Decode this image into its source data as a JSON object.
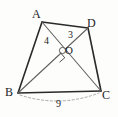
{
  "figure": {
    "kind": "geometry-diagram",
    "background_color": "#fdfdfc",
    "stroke_color": "#2a2a2a",
    "thin_stroke_color": "#6b6b6b",
    "dashed_color": "#8a8a8a",
    "canvas": {
      "width": 118,
      "height": 117
    }
  },
  "vertices": [
    {
      "name": "A",
      "label": "A",
      "x": 42,
      "y": 22,
      "label_x": 33,
      "label_y": 8
    },
    {
      "name": "D",
      "label": "D",
      "x": 88,
      "y": 28,
      "label_x": 88,
      "label_y": 17
    },
    {
      "name": "B",
      "label": "B",
      "x": 18,
      "y": 93,
      "label_x": 6,
      "label_y": 87
    },
    {
      "name": "C",
      "label": "C",
      "x": 101,
      "y": 91,
      "label_x": 102,
      "label_y": 89
    },
    {
      "name": "O",
      "label": "O",
      "x": 63,
      "y": 50,
      "label_x": 66,
      "label_y": 46
    }
  ],
  "edges": [
    {
      "name": "side-AB",
      "from": "A",
      "to": "B",
      "style": "solid",
      "weight": "thick"
    },
    {
      "name": "side-AD",
      "from": "A",
      "to": "D",
      "style": "solid",
      "weight": "thick"
    },
    {
      "name": "side-DC",
      "from": "D",
      "to": "C",
      "style": "solid",
      "weight": "thick"
    },
    {
      "name": "side-BC",
      "from": "B",
      "to": "C",
      "style": "solid",
      "weight": "thick"
    },
    {
      "name": "diagonal-AC",
      "from": "A",
      "to": "C",
      "style": "solid",
      "weight": "thin"
    },
    {
      "name": "diagonal-BD",
      "from": "B",
      "to": "D",
      "style": "solid",
      "weight": "thin"
    }
  ],
  "measures": [
    {
      "name": "segment-AO-length",
      "value": "4",
      "on": "diagonal-AC",
      "x": 44,
      "y": 37
    },
    {
      "name": "segment-OD-length",
      "value": "3",
      "on": "diagonal-BD",
      "x": 67,
      "y": 31
    },
    {
      "name": "side-BC-length",
      "value": "9",
      "on": "side-BC",
      "x": 56,
      "y": 99
    }
  ],
  "marks": [
    {
      "name": "right-angle-mark",
      "at": "O",
      "x": 63,
      "y": 50,
      "size": 7,
      "meaning": "diagonals are perpendicular"
    },
    {
      "name": "intersection-dot",
      "at": "O",
      "x": 63,
      "y": 50,
      "radius": 3
    },
    {
      "name": "bc-measure-arc",
      "style": "dashed",
      "from_x": 19,
      "from_y": 94,
      "to_x": 100,
      "to_y": 92,
      "sag": 9
    }
  ]
}
